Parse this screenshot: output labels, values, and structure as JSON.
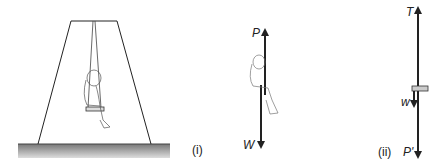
{
  "figure_i": {
    "caption": "(i)",
    "arrow_up_label": "P",
    "arrow_down_label": "W"
  },
  "figure_ii": {
    "caption": "(ii)",
    "arrow_up_label": "T",
    "arrow_small_label": "w",
    "arrow_down_label": "P'"
  },
  "colors": {
    "line": "#222222",
    "ground_top": "#888888",
    "ground_bottom": "#d8d8d8",
    "seat": "#cccccc"
  }
}
